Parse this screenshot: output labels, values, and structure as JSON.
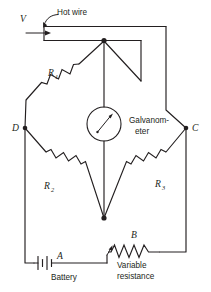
{
  "figure": {
    "kind": "wheatstone-bridge-circuit-diagram",
    "accent_color": "#231f20",
    "background_color": "#ffffff"
  },
  "labels": {
    "voltage": "V",
    "hot_wire": "Hot wire",
    "r1": "R",
    "r1_sub": "1",
    "r2": "R",
    "r2_sub": "2",
    "r3": "R",
    "r3_sub": "3",
    "galvanometer_line1": "Galvanom-",
    "galvanometer_line2": "eter",
    "node_d": "D",
    "node_c": "C",
    "node_a": "A",
    "node_b": "B",
    "battery": "Battery",
    "variable_resistance_line1": "Variable",
    "variable_resistance_line2": "resistance"
  },
  "components": [
    {
      "id": "hot-wire",
      "type": "resistive-wire",
      "label": "Hot wire"
    },
    {
      "id": "r1",
      "type": "resistor",
      "label": "R1"
    },
    {
      "id": "r2",
      "type": "resistor",
      "label": "R2"
    },
    {
      "id": "r3",
      "type": "resistor",
      "label": "R3"
    },
    {
      "id": "galvanometer",
      "type": "meter",
      "label": "Galvanometer"
    },
    {
      "id": "battery",
      "type": "battery",
      "label": "Battery",
      "terminal": "A"
    },
    {
      "id": "variable-resistance",
      "type": "rheostat",
      "label": "Variable resistance",
      "terminal": "B"
    }
  ],
  "nodes": [
    {
      "id": "D",
      "label": "D"
    },
    {
      "id": "C",
      "label": "C"
    },
    {
      "id": "A",
      "label": "A"
    },
    {
      "id": "B",
      "label": "B"
    }
  ]
}
